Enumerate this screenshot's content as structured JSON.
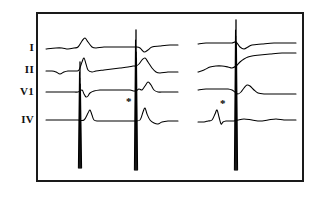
{
  "figure": {
    "kind": "ecg-strip",
    "width": 316,
    "height": 197,
    "background_color": "#ffffff",
    "frame": {
      "border_color": "#1a1a1a",
      "border_width": 2,
      "x": 36,
      "y": 12,
      "width": 268,
      "height": 170
    },
    "trace_color": "#000000"
  },
  "leads": [
    {
      "label": "I",
      "baseline_y": 48,
      "label_x": 20,
      "label_y": 42
    },
    {
      "label": "II",
      "baseline_y": 70,
      "label_x": 20,
      "label_y": 64
    },
    {
      "label": "V1",
      "baseline_y": 92,
      "label_x": 20,
      "label_y": 86
    },
    {
      "label": "IV",
      "baseline_y": 120,
      "label_x": 20,
      "label_y": 114
    }
  ],
  "annotations": [
    {
      "name": "asterisk-left",
      "symbol": "*",
      "x": 126,
      "y": 96
    },
    {
      "name": "asterisk-right",
      "symbol": "*",
      "x": 220,
      "y": 98
    }
  ],
  "chart_data": {
    "type": "line",
    "title": "",
    "xlabel": "",
    "ylabel": "",
    "grid": false,
    "legend": "none",
    "channels": [
      "I",
      "II",
      "V1",
      "IV"
    ],
    "panels": [
      {
        "name": "left-panel",
        "x_range": [
          46,
          178
        ],
        "beat_complex_x": [
          82,
          137
        ],
        "pacing_spike_x": [
          80,
          136
        ]
      },
      {
        "name": "right-panel",
        "x_range": [
          198,
          296
        ],
        "beat_complex_x": [
          237
        ],
        "pacing_spike_x": [
          236
        ]
      }
    ],
    "series": [
      {
        "name": "I",
        "baseline_y": 48,
        "points_left": [
          [
            46,
            49
          ],
          [
            56,
            48
          ],
          [
            62,
            48
          ],
          [
            68,
            49
          ],
          [
            74,
            48
          ],
          [
            78,
            47
          ],
          [
            82,
            41
          ],
          [
            85,
            38
          ],
          [
            88,
            42
          ],
          [
            92,
            47
          ],
          [
            96,
            48
          ],
          [
            104,
            47
          ],
          [
            114,
            47
          ],
          [
            124,
            47
          ],
          [
            132,
            47
          ],
          [
            136,
            47
          ],
          [
            140,
            48
          ],
          [
            144,
            52
          ],
          [
            148,
            50
          ],
          [
            152,
            47
          ],
          [
            160,
            46
          ],
          [
            170,
            45
          ],
          [
            178,
            45
          ]
        ],
        "points_right": [
          [
            198,
            44
          ],
          [
            206,
            43
          ],
          [
            214,
            43
          ],
          [
            222,
            43
          ],
          [
            228,
            43
          ],
          [
            232,
            43
          ],
          [
            236,
            42
          ],
          [
            240,
            47
          ],
          [
            244,
            49
          ],
          [
            248,
            47
          ],
          [
            252,
            45
          ],
          [
            262,
            44
          ],
          [
            274,
            43
          ],
          [
            286,
            43
          ],
          [
            296,
            43
          ]
        ]
      },
      {
        "name": "II",
        "baseline_y": 70,
        "points_left": [
          [
            46,
            71
          ],
          [
            52,
            71
          ],
          [
            56,
            72
          ],
          [
            60,
            74
          ],
          [
            64,
            72
          ],
          [
            68,
            71
          ],
          [
            72,
            71
          ],
          [
            76,
            71
          ],
          [
            79,
            70
          ],
          [
            82,
            62
          ],
          [
            84,
            58
          ],
          [
            86,
            64
          ],
          [
            88,
            70
          ],
          [
            92,
            72
          ],
          [
            96,
            71
          ],
          [
            104,
            70
          ],
          [
            112,
            69
          ],
          [
            120,
            68
          ],
          [
            128,
            67
          ],
          [
            133,
            66
          ],
          [
            136,
            66
          ],
          [
            139,
            64
          ],
          [
            142,
            60
          ],
          [
            145,
            58
          ],
          [
            148,
            62
          ],
          [
            152,
            68
          ],
          [
            156,
            72
          ],
          [
            160,
            73
          ],
          [
            168,
            72
          ],
          [
            176,
            72
          ],
          [
            178,
            72
          ]
        ],
        "points_right": [
          [
            198,
            72
          ],
          [
            204,
            70
          ],
          [
            210,
            67
          ],
          [
            216,
            66
          ],
          [
            222,
            66
          ],
          [
            228,
            67
          ],
          [
            232,
            68
          ],
          [
            236,
            66
          ],
          [
            240,
            62
          ],
          [
            244,
            59
          ],
          [
            248,
            57
          ],
          [
            252,
            56
          ],
          [
            260,
            55
          ],
          [
            270,
            54
          ],
          [
            282,
            53
          ],
          [
            296,
            53
          ]
        ]
      },
      {
        "name": "V1",
        "baseline_y": 92,
        "points_left": [
          [
            46,
            92
          ],
          [
            56,
            92
          ],
          [
            64,
            92
          ],
          [
            72,
            92
          ],
          [
            78,
            92
          ],
          [
            82,
            90
          ],
          [
            84,
            94
          ],
          [
            86,
            97
          ],
          [
            88,
            96
          ],
          [
            90,
            93
          ],
          [
            94,
            91
          ],
          [
            100,
            90
          ],
          [
            108,
            90
          ],
          [
            116,
            90
          ],
          [
            124,
            90
          ],
          [
            130,
            90
          ],
          [
            134,
            91
          ],
          [
            136,
            91
          ],
          [
            139,
            89
          ],
          [
            142,
            90
          ],
          [
            145,
            86
          ],
          [
            148,
            82
          ],
          [
            151,
            85
          ],
          [
            154,
            90
          ],
          [
            158,
            92
          ],
          [
            164,
            92
          ],
          [
            172,
            92
          ],
          [
            178,
            92
          ]
        ],
        "points_right": [
          [
            198,
            90
          ],
          [
            206,
            89
          ],
          [
            214,
            89
          ],
          [
            222,
            89
          ],
          [
            228,
            89
          ],
          [
            232,
            90
          ],
          [
            235,
            92
          ],
          [
            238,
            94
          ],
          [
            241,
            92
          ],
          [
            244,
            88
          ],
          [
            247,
            85
          ],
          [
            250,
            86
          ],
          [
            254,
            90
          ],
          [
            258,
            93
          ],
          [
            264,
            94
          ],
          [
            272,
            94
          ],
          [
            284,
            94
          ],
          [
            296,
            94
          ]
        ]
      },
      {
        "name": "IV",
        "baseline_y": 120,
        "points_left": [
          [
            46,
            120
          ],
          [
            56,
            120
          ],
          [
            64,
            120
          ],
          [
            72,
            120
          ],
          [
            78,
            120
          ],
          [
            84,
            120
          ],
          [
            88,
            113
          ],
          [
            90,
            110
          ],
          [
            92,
            115
          ],
          [
            94,
            120
          ],
          [
            98,
            121
          ],
          [
            104,
            121
          ],
          [
            112,
            121
          ],
          [
            120,
            121
          ],
          [
            128,
            121
          ],
          [
            134,
            121
          ],
          [
            140,
            120
          ],
          [
            143,
            112
          ],
          [
            145,
            108
          ],
          [
            147,
            114
          ],
          [
            150,
            120
          ],
          [
            154,
            123
          ],
          [
            158,
            124
          ],
          [
            162,
            122
          ],
          [
            168,
            121
          ],
          [
            174,
            121
          ],
          [
            178,
            121
          ]
        ],
        "points_right": [
          [
            198,
            122
          ],
          [
            204,
            122
          ],
          [
            208,
            121
          ],
          [
            212,
            120
          ],
          [
            215,
            114
          ],
          [
            217,
            110
          ],
          [
            219,
            117
          ],
          [
            221,
            124
          ],
          [
            223,
            122
          ],
          [
            226,
            121
          ],
          [
            230,
            121
          ],
          [
            234,
            121
          ],
          [
            238,
            120
          ],
          [
            244,
            119
          ],
          [
            252,
            120
          ],
          [
            260,
            121
          ],
          [
            268,
            120
          ],
          [
            276,
            119
          ],
          [
            284,
            120
          ],
          [
            292,
            120
          ],
          [
            296,
            120
          ]
        ]
      }
    ],
    "pacing_spikes": [
      {
        "panel": "left-panel",
        "x": 80,
        "top_y": 62,
        "bottom_y": 168
      },
      {
        "panel": "left-panel",
        "x": 136,
        "top_y": 30,
        "bottom_y": 170
      },
      {
        "panel": "right-panel",
        "x": 236,
        "top_y": 20,
        "bottom_y": 170
      }
    ]
  }
}
